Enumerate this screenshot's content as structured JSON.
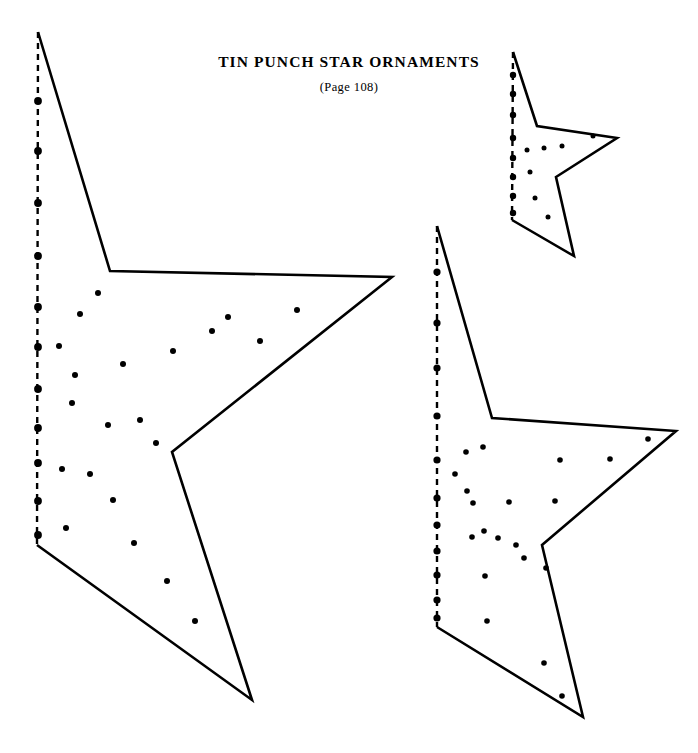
{
  "page": {
    "background_color": "#ffffff",
    "ink_color": "#000000",
    "width": 698,
    "height": 753
  },
  "heading": {
    "title": "TIN PUNCH STAR ORNAMENTS",
    "subtitle": "(Page 108)"
  },
  "chart_data": {
    "type": "diagram",
    "title": "Tin Punch Star Ornaments",
    "subtitle": "(Page 108)",
    "stroke_width": 2.6,
    "fold_stroke_width": 2.4,
    "fold_dash": "6 5",
    "shapes": [
      {
        "name": "large-star",
        "label": "Large star half-pattern",
        "dot_radius": 3.0,
        "fold_dot_radius": 3.9,
        "outline": [
          [
            38,
            32
          ],
          [
            110,
            271
          ],
          [
            392,
            277
          ],
          [
            172,
            452
          ],
          [
            252,
            700
          ],
          [
            37,
            545
          ]
        ],
        "fold_line": [
          [
            38,
            32
          ],
          [
            37,
            545
          ]
        ],
        "fold_dots": [
          [
            38,
            101
          ],
          [
            38,
            151
          ],
          [
            38,
            203
          ],
          [
            38,
            256
          ],
          [
            38,
            307
          ],
          [
            38,
            347
          ],
          [
            38,
            389
          ],
          [
            38,
            428
          ],
          [
            38,
            463
          ],
          [
            38,
            501
          ],
          [
            38,
            535
          ]
        ],
        "punch_dots": [
          [
            98,
            293
          ],
          [
            80,
            314
          ],
          [
            123,
            364
          ],
          [
            75,
            375
          ],
          [
            72,
            403
          ],
          [
            108,
            425
          ],
          [
            90,
            474
          ],
          [
            113,
            500
          ],
          [
            134,
            543
          ],
          [
            167,
            581
          ],
          [
            195,
            621
          ],
          [
            212,
            331
          ],
          [
            173,
            351
          ],
          [
            140,
            420
          ],
          [
            156,
            443
          ],
          [
            260,
            341
          ],
          [
            297,
            310
          ],
          [
            228,
            317
          ],
          [
            59,
            346
          ],
          [
            62,
            469
          ],
          [
            66,
            528
          ]
        ]
      },
      {
        "name": "medium-star",
        "label": "Medium star half-pattern",
        "dot_radius": 2.8,
        "fold_dot_radius": 3.6,
        "outline": [
          [
            437,
            226
          ],
          [
            492,
            418
          ],
          [
            676,
            431
          ],
          [
            542,
            545
          ],
          [
            583,
            717
          ],
          [
            437,
            627
          ]
        ],
        "fold_line": [
          [
            437,
            226
          ],
          [
            437,
            627
          ]
        ],
        "fold_dots": [
          [
            437,
            272
          ],
          [
            437,
            323
          ],
          [
            437,
            368
          ],
          [
            437,
            416
          ],
          [
            437,
            460
          ],
          [
            437,
            498
          ],
          [
            437,
            525
          ],
          [
            437,
            551
          ],
          [
            437,
            575
          ],
          [
            437,
            600
          ],
          [
            437,
            618
          ]
        ],
        "punch_dots": [
          [
            483,
            447
          ],
          [
            466,
            452
          ],
          [
            467,
            491
          ],
          [
            455,
            474
          ],
          [
            473,
            503
          ],
          [
            484,
            531
          ],
          [
            472,
            537
          ],
          [
            498,
            538
          ],
          [
            509,
            502
          ],
          [
            516,
            545
          ],
          [
            524,
            558
          ],
          [
            546,
            568
          ],
          [
            555,
            501
          ],
          [
            560,
            460
          ],
          [
            610,
            459
          ],
          [
            648,
            439
          ],
          [
            485,
            576
          ],
          [
            487,
            621
          ],
          [
            544,
            663
          ],
          [
            562,
            696
          ]
        ]
      },
      {
        "name": "small-star",
        "label": "Small star half-pattern",
        "dot_radius": 2.5,
        "fold_dot_radius": 3.2,
        "outline": [
          [
            513,
            52
          ],
          [
            537,
            126
          ],
          [
            617,
            138
          ],
          [
            556,
            177
          ],
          [
            574,
            256
          ],
          [
            512,
            220
          ]
        ],
        "fold_line": [
          [
            513,
            52
          ],
          [
            512,
            220
          ]
        ],
        "fold_dots": [
          [
            513,
            75
          ],
          [
            513,
            94
          ],
          [
            513,
            115
          ],
          [
            513,
            138
          ],
          [
            513,
            158
          ],
          [
            513,
            177
          ],
          [
            513,
            196
          ],
          [
            513,
            213
          ]
        ],
        "punch_dots": [
          [
            527,
            150
          ],
          [
            544,
            148
          ],
          [
            562,
            146
          ],
          [
            593,
            136
          ],
          [
            530,
            172
          ],
          [
            535,
            198
          ],
          [
            548,
            217
          ]
        ]
      }
    ]
  }
}
